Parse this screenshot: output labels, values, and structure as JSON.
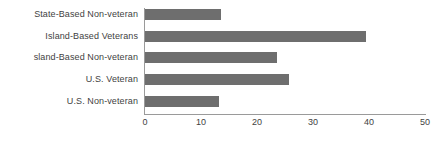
{
  "chart_data": {
    "type": "bar",
    "orientation": "horizontal",
    "title": "",
    "xlabel": "",
    "ylabel": "",
    "categories": [
      "State-Based Non-veteran",
      "Island-Based Veterans",
      "sland-Based Non-veteran",
      "U.S. Veteran",
      "U.S. Non-veteran"
    ],
    "values": [
      13.5,
      39.5,
      23.5,
      25.8,
      13.3
    ],
    "xlim": [
      0,
      50
    ],
    "xticks": [
      0,
      10,
      20,
      30,
      40,
      50
    ],
    "xticklabels": [
      "0",
      "10",
      "20",
      "30",
      "40",
      "50"
    ],
    "grid": false,
    "legend": false,
    "bar_color": "#6e6e6e",
    "axis_color": "#9a9a9a",
    "text_color": "#3f3f3f",
    "background_color": "#ffffff"
  }
}
